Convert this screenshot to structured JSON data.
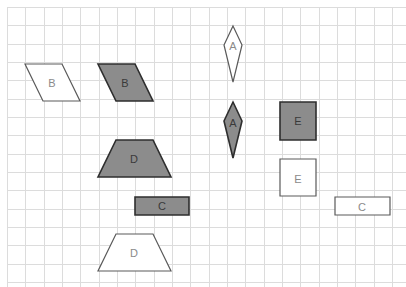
{
  "diagram": {
    "grid": {
      "origin_x": 7,
      "origin_y": 7,
      "step": 18.33,
      "width": 406,
      "height": 287,
      "line_color": "#dcdcdc"
    },
    "colors": {
      "fill": "#8c8c8c",
      "filled_stroke": "#2e2e2e",
      "outline_stroke": "#5a5a5a",
      "background": "#ffffff"
    },
    "shapes": [
      {
        "id": "B-outline",
        "label": "B",
        "kind": "parallelogram",
        "style": "outline",
        "points": [
          [
            25,
            64
          ],
          [
            62,
            64
          ],
          [
            80,
            101
          ],
          [
            43,
            101
          ]
        ],
        "label_pos": [
          52,
          83
        ]
      },
      {
        "id": "B-filled",
        "label": "B",
        "kind": "parallelogram",
        "style": "filled",
        "points": [
          [
            98,
            64
          ],
          [
            135,
            64
          ],
          [
            153,
            101
          ],
          [
            116,
            101
          ]
        ],
        "label_pos": [
          125,
          83
        ]
      },
      {
        "id": "A-outline",
        "label": "A",
        "kind": "kite",
        "style": "outline",
        "points": [
          [
            233,
            26
          ],
          [
            242,
            45
          ],
          [
            233,
            82
          ],
          [
            224,
            45
          ]
        ],
        "label_pos": [
          233,
          46
        ]
      },
      {
        "id": "A-filled",
        "label": "A",
        "kind": "kite",
        "style": "filled",
        "points": [
          [
            233,
            102
          ],
          [
            242,
            121
          ],
          [
            233,
            158
          ],
          [
            224,
            121
          ]
        ],
        "label_pos": [
          233,
          123
        ]
      },
      {
        "id": "E-filled",
        "label": "E",
        "kind": "square",
        "style": "filled",
        "points": [
          [
            280,
            102
          ],
          [
            316,
            102
          ],
          [
            316,
            140
          ],
          [
            280,
            140
          ]
        ],
        "label_pos": [
          298,
          121
        ]
      },
      {
        "id": "E-outline",
        "label": "E",
        "kind": "square",
        "style": "outline",
        "points": [
          [
            280,
            159
          ],
          [
            316,
            159
          ],
          [
            316,
            196
          ],
          [
            280,
            196
          ]
        ],
        "label_pos": [
          298,
          179
        ]
      },
      {
        "id": "D-filled",
        "label": "D",
        "kind": "trapezoid",
        "style": "filled",
        "points": [
          [
            116,
            140
          ],
          [
            153,
            140
          ],
          [
            171,
            177
          ],
          [
            98,
            177
          ]
        ],
        "label_pos": [
          134,
          159
        ]
      },
      {
        "id": "C-filled",
        "label": "C",
        "kind": "rectangle",
        "style": "filled",
        "points": [
          [
            135,
            197
          ],
          [
            189,
            197
          ],
          [
            189,
            215
          ],
          [
            135,
            215
          ]
        ],
        "label_pos": [
          162,
          206
        ]
      },
      {
        "id": "C-outline",
        "label": "C",
        "kind": "rectangle",
        "style": "outline",
        "points": [
          [
            335,
            197
          ],
          [
            390,
            197
          ],
          [
            390,
            215
          ],
          [
            335,
            215
          ]
        ],
        "label_pos": [
          362,
          207
        ]
      },
      {
        "id": "D-outline",
        "label": "D",
        "kind": "trapezoid",
        "style": "outline",
        "points": [
          [
            116,
            234
          ],
          [
            153,
            234
          ],
          [
            171,
            271
          ],
          [
            98,
            271
          ]
        ],
        "label_pos": [
          134,
          253
        ]
      }
    ]
  }
}
